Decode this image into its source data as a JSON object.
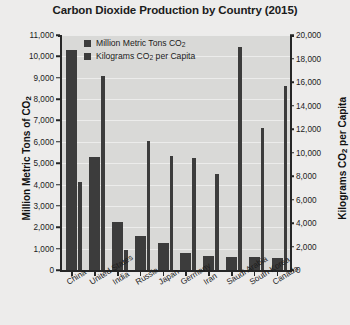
{
  "chart_data": {
    "type": "bar",
    "title": "Carbon Dioxide Production by Country (2015)",
    "categories": [
      "China",
      "United States",
      "India",
      "Russia",
      "Japan",
      "Germany",
      "Iran",
      "Saudi Arabia",
      "South Korea",
      "Canada"
    ],
    "series": [
      {
        "name": "Million Metric Tons CO2",
        "axis": "left",
        "values": [
          10290,
          5300,
          2240,
          1610,
          1250,
          780,
          650,
          600,
          620,
          560
        ]
      },
      {
        "name": "Kilograms CO2 per Capita",
        "axis": "right",
        "values": [
          7500,
          16500,
          1700,
          11000,
          9700,
          9500,
          8200,
          19000,
          12100,
          15700
        ]
      }
    ],
    "xlabel": "",
    "ylabel_left": "Million Metric Tons of CO2",
    "ylabel_right": "Kilograms CO2 per Capita",
    "ylim_left": [
      0,
      11000
    ],
    "ylim_right": [
      0,
      20000
    ],
    "yticks_left": [
      0,
      1000,
      2000,
      3000,
      4000,
      5000,
      6000,
      7000,
      8000,
      9000,
      10000,
      11000
    ],
    "yticks_right": [
      0,
      2000,
      4000,
      6000,
      8000,
      10000,
      12000,
      14000,
      16000,
      18000,
      20000
    ],
    "ytick_labels_left": [
      "0",
      "1,000",
      "2,000",
      "3,000",
      "4,000",
      "5,000",
      "6,000",
      "7,000",
      "8,000",
      "9,000",
      "10,000",
      "11,000"
    ],
    "ytick_labels_right": [
      "0",
      "2,000",
      "4,000",
      "6,000",
      "8,000",
      "10,000",
      "12,000",
      "14,000",
      "16,000",
      "18,000",
      "20,000"
    ],
    "grid": true,
    "legend_position": "top-left-inside",
    "bar_color": "#3c3c3c",
    "plot_background": "#d9d9d7",
    "figure_background": "#edeceb"
  },
  "axis_titles": {
    "left_prefix": "Million Metric Tons of CO",
    "left_sub": "2",
    "right_prefix": "Kilograms CO",
    "right_sub": "2",
    "right_suffix": " per Capita"
  },
  "legend": {
    "items": [
      {
        "prefix": "Million Metric Tons CO",
        "sub": "2",
        "suffix": ""
      },
      {
        "prefix": "Kilograms CO",
        "sub": "2",
        "suffix": " per Capita"
      }
    ]
  }
}
